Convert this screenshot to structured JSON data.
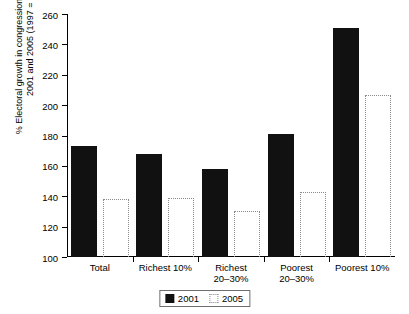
{
  "chart_data": {
    "type": "bar",
    "title": "",
    "xlabel": "",
    "ylabel": "% Electoral growth in congressional elections of 2001 and 2005 (1997 = 100)",
    "ylabel_lines": [
      "% Electoral growth in congressional elections of",
      "2001 and 2005 (1997 = 100)"
    ],
    "ylim": [
      100,
      260
    ],
    "ytick_values": [
      100,
      120,
      140,
      160,
      180,
      200,
      220,
      240,
      260
    ],
    "ytick_labels": [
      "100",
      "120",
      "140",
      "160",
      "180",
      "200",
      "220",
      "240",
      "260"
    ],
    "grid": false,
    "legend_position": "bottom-center",
    "categories": [
      "Total",
      "Richest 10%",
      "Richest 20–30%",
      "Poorest 20–30%",
      "Poorest 10%"
    ],
    "category_lines": [
      [
        "Total"
      ],
      [
        "Richest 10%"
      ],
      [
        "Richest",
        "20–30%"
      ],
      [
        "Poorest",
        "20–30%"
      ],
      [
        "Poorest 10%"
      ]
    ],
    "series": [
      {
        "name": "2001",
        "style": "solid-filled",
        "color": "#111111",
        "values": [
          173,
          168,
          158,
          181,
          251
        ]
      },
      {
        "name": "2005",
        "style": "dotted-outline",
        "color": "#8a8a8a",
        "values": [
          138,
          139,
          130,
          143,
          207
        ]
      }
    ]
  },
  "legend": {
    "items": [
      {
        "label": "2001",
        "swatch": "filled-square-icon"
      },
      {
        "label": "2005",
        "swatch": "dotted-square-icon"
      }
    ]
  }
}
